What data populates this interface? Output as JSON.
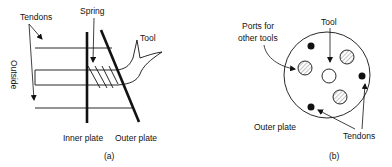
{
  "figure_a": {
    "caption": "(a)",
    "labels": {
      "tendons": "Tendons",
      "spring": "Spring",
      "tool": "Tool",
      "outside": "Outside",
      "inner_plate": "Inner plate",
      "outer_plate": "Outer plate"
    }
  },
  "figure_b": {
    "caption": "(b)",
    "labels": {
      "ports_line1": "Ports for",
      "ports_line2": "other tools",
      "tool": "Tool",
      "outer_plate": "Outer plate",
      "tendons": "Tendons"
    }
  },
  "colors": {
    "ink": "#111111",
    "hatch": "#9a9a9a",
    "background": "#ffffff"
  }
}
